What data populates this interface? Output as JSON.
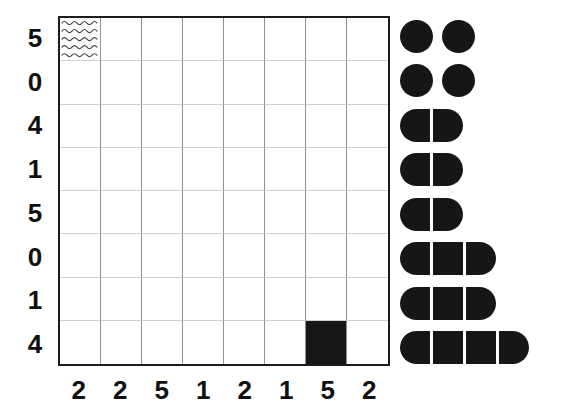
{
  "grid": {
    "rows": 8,
    "columns": 8,
    "row_labels": [
      "5",
      "0",
      "4",
      "1",
      "5",
      "0",
      "1",
      "4"
    ],
    "column_labels": [
      "2",
      "2",
      "5",
      "1",
      "2",
      "1",
      "5",
      "2"
    ],
    "border_color": "#1c1c1c",
    "vertical_line_color": "#8f8f8f",
    "horizontal_line_color": "#cfcfcf",
    "marked_cells": [
      {
        "row": 1,
        "column": 1,
        "fill": "wave",
        "name": "wavy-pattern-cell"
      },
      {
        "row": 8,
        "column": 7,
        "fill": "solid",
        "name": "solid-black-cell"
      }
    ]
  },
  "glyph_panel": {
    "fill_color": "#161616",
    "rows": [
      {
        "style": "separate",
        "segments": 2,
        "total_units": 2
      },
      {
        "style": "separate",
        "segments": 2,
        "total_units": 2
      },
      {
        "style": "joined",
        "segments": 2,
        "total_units": 2
      },
      {
        "style": "joined",
        "segments": 2,
        "total_units": 2
      },
      {
        "style": "joined",
        "segments": 2,
        "total_units": 2
      },
      {
        "style": "joined",
        "segments": 3,
        "total_units": 3
      },
      {
        "style": "joined",
        "segments": 3,
        "total_units": 3
      },
      {
        "style": "joined",
        "segments": 4,
        "total_units": 4
      }
    ]
  }
}
